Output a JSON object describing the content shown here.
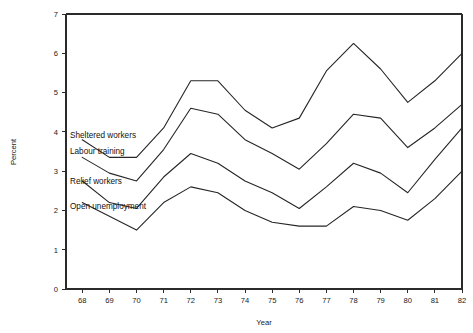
{
  "chart_data": {
    "type": "line",
    "title": "",
    "xlabel": "Year",
    "ylabel": "Percent",
    "xlim": [
      67.4,
      82
    ],
    "ylim": [
      0,
      7
    ],
    "grid": false,
    "legend_position": "inline-left",
    "x": [
      68,
      69,
      70,
      71,
      72,
      73,
      74,
      75,
      76,
      77,
      78,
      79,
      80,
      81,
      82
    ],
    "xtick_labels": [
      "68",
      "69",
      "70",
      "71",
      "72",
      "73",
      "74",
      "75",
      "76",
      "77",
      "78",
      "79",
      "80",
      "81",
      "82"
    ],
    "ytick_labels": [
      "0",
      "1",
      "2",
      "3",
      "4",
      "5",
      "6",
      "7"
    ],
    "yticks": [
      0,
      1,
      2,
      3,
      4,
      5,
      6,
      7
    ],
    "note": "Cumulative stacked totals: each upper line is the running sum including lower categories.",
    "series": [
      {
        "name": "Sheltered workers",
        "label_position": "inline",
        "values": [
          3.8,
          3.35,
          3.35,
          4.1,
          5.3,
          5.3,
          4.55,
          4.1,
          4.35,
          5.55,
          6.25,
          5.6,
          4.75,
          5.3,
          6.0
        ]
      },
      {
        "name": "Labour training",
        "label_position": "inline",
        "values": [
          3.35,
          2.95,
          2.75,
          3.55,
          4.6,
          4.45,
          3.8,
          3.45,
          3.05,
          3.7,
          4.45,
          4.35,
          3.6,
          4.1,
          4.7
        ]
      },
      {
        "name": "Relief workers",
        "label_position": "inline",
        "values": [
          2.75,
          2.2,
          2.05,
          2.85,
          3.45,
          3.2,
          2.75,
          2.45,
          2.05,
          2.6,
          3.2,
          2.95,
          2.45,
          3.3,
          4.1
        ]
      },
      {
        "name": "Open unemployment",
        "label_position": "inline",
        "values": [
          2.2,
          1.85,
          1.5,
          2.2,
          2.6,
          2.45,
          2.0,
          1.7,
          1.6,
          1.6,
          2.1,
          2.0,
          1.75,
          2.3,
          3.0
        ]
      }
    ]
  },
  "axes": {
    "y_title": "Percent",
    "x_title": "Year"
  },
  "colors": {
    "line": "#262626",
    "axis": "#2b2b2b",
    "background": "#ffffff",
    "text": "#1a1a1a"
  }
}
